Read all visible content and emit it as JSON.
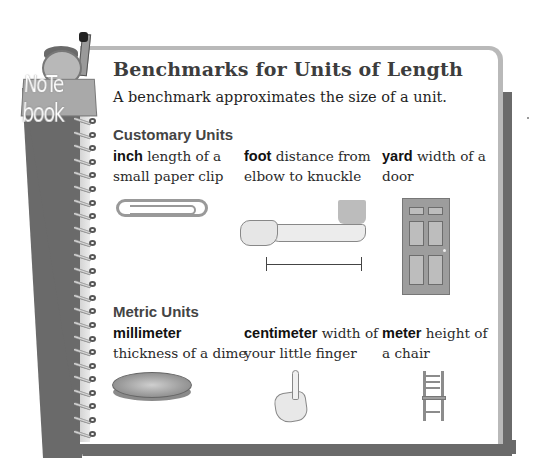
{
  "notebook": {
    "badge_label": "NoTe book"
  },
  "header": {
    "title": "Benchmarks for Units of Length",
    "subtitle": "A benchmark approximates the size of a unit."
  },
  "sections": [
    {
      "heading": "Customary Units",
      "items": [
        {
          "term": "inch",
          "description": " length of a small paper clip",
          "illustration": "paper-clip-icon"
        },
        {
          "term": "foot",
          "description": " distance from elbow to knuckle",
          "illustration": "forearm-icon"
        },
        {
          "term": "yard",
          "description": " width of a door",
          "illustration": "door-icon"
        }
      ]
    },
    {
      "heading": "Metric Units",
      "items": [
        {
          "term": "millimeter",
          "description": " thickness of a dime",
          "illustration": "dime-icon"
        },
        {
          "term": "centimeter",
          "description": " width of your little finger",
          "illustration": "finger-icon"
        },
        {
          "term": "meter",
          "description": " height of a chair",
          "illustration": "chair-icon"
        }
      ]
    }
  ],
  "colors": {
    "backing_gray": "#6a6a6a",
    "paper_border": "#b9b9b9",
    "title_text": "#3d3d3d"
  }
}
